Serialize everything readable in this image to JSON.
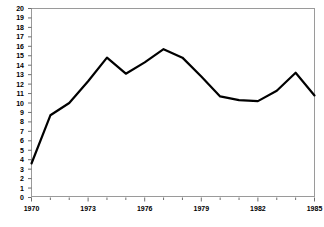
{
  "chart_data": {
    "type": "line",
    "title": "",
    "subtitle": "",
    "xlabel": "",
    "ylabel": "",
    "x": [
      1970,
      1971,
      1972,
      1973,
      1974,
      1975,
      1976,
      1977,
      1978,
      1979,
      1980,
      1981,
      1982,
      1983,
      1984,
      1985
    ],
    "values": [
      3.6,
      8.7,
      10.0,
      12.3,
      14.8,
      13.1,
      14.3,
      15.7,
      14.8,
      12.8,
      10.7,
      10.3,
      10.2,
      11.3,
      13.2,
      10.8
    ],
    "series": [
      {
        "name": "series-1",
        "values": [
          3.6,
          8.7,
          10.0,
          12.3,
          14.8,
          13.1,
          14.3,
          15.7,
          14.8,
          12.8,
          10.7,
          10.3,
          10.2,
          11.3,
          13.2,
          10.8
        ],
        "color": "#000000",
        "line_width": 2.2
      }
    ],
    "xlim": [
      1970,
      1985
    ],
    "ylim": [
      0,
      20
    ],
    "ytick_values": [
      0,
      1,
      2,
      3,
      4,
      5,
      6,
      7,
      8,
      9,
      10,
      11,
      12,
      13,
      14,
      15,
      16,
      17,
      18,
      19,
      20
    ],
    "ytick_labels": [
      "0",
      "1",
      "2",
      "3",
      "4",
      "5",
      "6",
      "7",
      "8",
      "9",
      "10",
      "11",
      "12",
      "13",
      "14",
      "15",
      "16",
      "17",
      "18",
      "19",
      "20"
    ],
    "xtick_major_values": [
      1970,
      1973,
      1976,
      1979,
      1982,
      1985
    ],
    "xtick_major_labels": [
      "1970",
      "1973",
      "1976",
      "1979",
      "1982",
      "1985"
    ],
    "xtick_minor_values": [
      1971,
      1972,
      1974,
      1975,
      1977,
      1978,
      1980,
      1981,
      1983,
      1984
    ],
    "grid": false,
    "legend": null,
    "legend_position": "none",
    "annotations": [],
    "frame_color": "#9a9a9a",
    "tick_color": "#6e6e6e",
    "background": "#ffffff"
  }
}
